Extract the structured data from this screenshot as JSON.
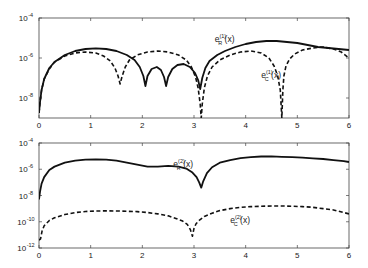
{
  "chart_data": [
    {
      "type": "line",
      "panel": "top",
      "title": "",
      "xlabel": "",
      "ylabel": "",
      "yscale": "log",
      "xlim": [
        0,
        6
      ],
      "ylim": [
        1e-09,
        0.0001
      ],
      "x_ticks": [
        "0",
        "1",
        "2",
        "3",
        "4",
        "5",
        "6"
      ],
      "y_ticks": [
        {
          "base": "10",
          "exp": "-4",
          "value": -4
        },
        {
          "base": "10",
          "exp": "-6",
          "value": -6
        },
        {
          "base": "10",
          "exp": "-8",
          "value": -8
        }
      ],
      "grid": false,
      "series": [
        {
          "name": "e_R^(1)(x)",
          "label_main": "e",
          "label_sup": "(1)",
          "label_sub": "R",
          "label_tail": "(x)",
          "style": "solid",
          "x": [
            0.0,
            0.02,
            0.05,
            0.1,
            0.2,
            0.3,
            0.5,
            0.7,
            0.9,
            1.1,
            1.3,
            1.5,
            1.7,
            1.85,
            1.95,
            2.02,
            2.06,
            2.1,
            2.18,
            2.28,
            2.36,
            2.42,
            2.46,
            2.5,
            2.58,
            2.68,
            2.8,
            2.92,
            3.02,
            3.08,
            3.12,
            3.16,
            3.22,
            3.3,
            3.45,
            3.6,
            3.8,
            4.0,
            4.2,
            4.4,
            4.6,
            4.8,
            5.0,
            5.2,
            5.4,
            5.6,
            5.8,
            6.0
          ],
          "log10y": [
            -8.75,
            -8.2,
            -7.6,
            -7.05,
            -6.5,
            -6.2,
            -5.85,
            -5.65,
            -5.55,
            -5.52,
            -5.55,
            -5.65,
            -5.85,
            -6.1,
            -6.45,
            -6.9,
            -7.4,
            -6.9,
            -6.55,
            -6.45,
            -6.6,
            -6.95,
            -7.4,
            -6.95,
            -6.55,
            -6.35,
            -6.3,
            -6.45,
            -6.75,
            -7.1,
            -7.55,
            -7.0,
            -6.5,
            -6.15,
            -5.85,
            -5.65,
            -5.45,
            -5.3,
            -5.2,
            -5.15,
            -5.15,
            -5.2,
            -5.25,
            -5.35,
            -5.45,
            -5.5,
            -5.55,
            -5.6
          ]
        },
        {
          "name": "e_C^(1)(x)",
          "label_main": "e",
          "label_sup": "(1)",
          "label_sub": "C",
          "label_tail": "(x)",
          "style": "dashed",
          "x": [
            0.0,
            0.02,
            0.05,
            0.1,
            0.2,
            0.3,
            0.5,
            0.7,
            0.9,
            1.1,
            1.25,
            1.38,
            1.47,
            1.53,
            1.57,
            1.61,
            1.67,
            1.75,
            1.9,
            2.1,
            2.3,
            2.5,
            2.7,
            2.85,
            2.95,
            3.03,
            3.08,
            3.12,
            3.14,
            3.16,
            3.2,
            3.26,
            3.35,
            3.5,
            3.7,
            3.9,
            4.1,
            4.3,
            4.45,
            4.55,
            4.62,
            4.67,
            4.7,
            4.72,
            4.74,
            4.78,
            4.85,
            4.95,
            5.1,
            5.3,
            5.5,
            5.7,
            5.85,
            6.0
          ],
          "log10y": [
            -8.75,
            -8.2,
            -7.6,
            -7.05,
            -6.55,
            -6.2,
            -5.9,
            -5.75,
            -5.7,
            -5.75,
            -5.9,
            -6.15,
            -6.5,
            -6.9,
            -7.3,
            -6.9,
            -6.45,
            -6.1,
            -5.85,
            -5.7,
            -5.65,
            -5.7,
            -5.85,
            -6.1,
            -6.45,
            -6.95,
            -7.5,
            -8.3,
            -9.0,
            -8.3,
            -7.5,
            -6.9,
            -6.45,
            -6.1,
            -5.85,
            -5.7,
            -5.65,
            -5.75,
            -6.0,
            -6.4,
            -6.9,
            -7.6,
            -9.0,
            -7.6,
            -6.9,
            -6.4,
            -6.05,
            -5.8,
            -5.6,
            -5.5,
            -5.45,
            -5.55,
            -5.7,
            -6.0
          ]
        }
      ],
      "annotations": [
        {
          "series": 0,
          "x": 3.4,
          "log10y": -5.2
        },
        {
          "series": 1,
          "x": 4.3,
          "log10y": -7.0
        }
      ]
    },
    {
      "type": "line",
      "panel": "bottom",
      "title": "",
      "xlabel": "",
      "ylabel": "",
      "yscale": "log",
      "xlim": [
        0,
        6
      ],
      "ylim": [
        1e-12,
        0.0001
      ],
      "x_ticks": [
        "0",
        "1",
        "2",
        "3",
        "4",
        "5",
        "6"
      ],
      "y_ticks": [
        {
          "base": "10",
          "exp": "-4",
          "value": -4
        },
        {
          "base": "10",
          "exp": "-6",
          "value": -6
        },
        {
          "base": "10",
          "exp": "-8",
          "value": -8
        },
        {
          "base": "10",
          "exp": "-10",
          "value": -10
        },
        {
          "base": "10",
          "exp": "-12",
          "value": -12
        }
      ],
      "grid": false,
      "series": [
        {
          "name": "e_R^(2)(x)",
          "label_main": "e",
          "label_sup": "(2)",
          "label_sub": "R",
          "label_tail": "(x)",
          "style": "solid",
          "x": [
            0.0,
            0.02,
            0.05,
            0.1,
            0.2,
            0.3,
            0.5,
            0.7,
            0.9,
            1.1,
            1.3,
            1.5,
            1.7,
            1.9,
            2.1,
            2.3,
            2.5,
            2.7,
            2.85,
            2.97,
            3.05,
            3.1,
            3.14,
            3.18,
            3.25,
            3.35,
            3.5,
            3.7,
            3.9,
            4.1,
            4.3,
            4.5,
            4.7,
            4.9,
            5.1,
            5.3,
            5.5,
            5.7,
            5.9,
            6.0
          ],
          "log10y": [
            -8.3,
            -7.7,
            -7.1,
            -6.6,
            -6.05,
            -5.8,
            -5.5,
            -5.35,
            -5.27,
            -5.25,
            -5.27,
            -5.35,
            -5.5,
            -5.65,
            -5.8,
            -5.8,
            -5.75,
            -5.8,
            -5.95,
            -6.25,
            -6.6,
            -7.0,
            -7.4,
            -6.9,
            -6.3,
            -5.85,
            -5.5,
            -5.3,
            -5.15,
            -5.07,
            -5.03,
            -5.02,
            -5.05,
            -5.08,
            -5.12,
            -5.17,
            -5.22,
            -5.3,
            -5.38,
            -5.45
          ]
        },
        {
          "name": "e_C^(2)(x)",
          "label_main": "e",
          "label_sup": "(2)",
          "label_sub": "C",
          "label_tail": "(x)",
          "style": "dashed",
          "x": [
            0.0,
            0.03,
            0.06,
            0.1,
            0.2,
            0.3,
            0.5,
            0.7,
            0.9,
            1.1,
            1.3,
            1.5,
            1.7,
            1.9,
            2.1,
            2.3,
            2.5,
            2.65,
            2.78,
            2.87,
            2.93,
            2.97,
            3.0,
            3.04,
            3.1,
            3.2,
            3.35,
            3.5,
            3.7,
            3.9,
            4.1,
            4.3,
            4.5,
            4.7,
            4.9,
            5.1,
            5.3,
            5.5,
            5.7,
            5.9,
            6.0
          ],
          "log10y": [
            -11.4,
            -11.3,
            -10.7,
            -10.3,
            -9.9,
            -9.7,
            -9.45,
            -9.3,
            -9.22,
            -9.18,
            -9.17,
            -9.18,
            -9.2,
            -9.23,
            -9.3,
            -9.4,
            -9.55,
            -9.75,
            -9.95,
            -10.2,
            -10.6,
            -11.1,
            -10.5,
            -10.15,
            -9.9,
            -9.6,
            -9.35,
            -9.15,
            -9.0,
            -8.9,
            -8.85,
            -8.82,
            -8.8,
            -8.8,
            -8.82,
            -8.85,
            -8.9,
            -9.0,
            -9.1,
            -9.3,
            -9.4
          ]
        }
      ],
      "annotations": [
        {
          "series": 0,
          "x": 2.6,
          "log10y": -5.85
        },
        {
          "series": 1,
          "x": 3.7,
          "log10y": -10.1
        }
      ]
    }
  ],
  "layout": {
    "panels": [
      {
        "left": 39,
        "right": 349,
        "top": 18,
        "bottom": 118,
        "ytop": -4,
        "ybot": -9
      },
      {
        "left": 39,
        "right": 349,
        "top": 143,
        "bottom": 248,
        "ytop": -4,
        "ybot": -12
      }
    ],
    "line_color": "#111111",
    "axis_color": "#444444"
  }
}
